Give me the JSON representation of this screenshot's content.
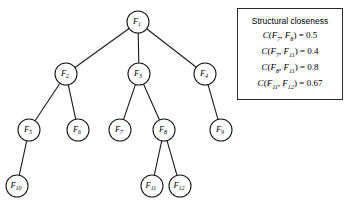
{
  "figure": {
    "type": "tree-diagram",
    "background_color": "#ffffff",
    "line_color": "#1a1a1a"
  },
  "tree": {
    "nodes": [
      {
        "id": "F1",
        "base": "F",
        "sub": "1",
        "cx": 138,
        "cy": 22,
        "r": 11
      },
      {
        "id": "F2",
        "base": "F",
        "sub": "2",
        "cx": 66,
        "cy": 74,
        "r": 11
      },
      {
        "id": "F3",
        "base": "F",
        "sub": "3",
        "cx": 139,
        "cy": 74,
        "r": 11
      },
      {
        "id": "F4",
        "base": "F",
        "sub": "4",
        "cx": 205,
        "cy": 74,
        "r": 11
      },
      {
        "id": "F5",
        "base": "F",
        "sub": "5",
        "cx": 29,
        "cy": 130,
        "r": 11
      },
      {
        "id": "F6",
        "base": "F",
        "sub": "6",
        "cx": 78,
        "cy": 130,
        "r": 11
      },
      {
        "id": "F7",
        "base": "F",
        "sub": "7",
        "cx": 120,
        "cy": 130,
        "r": 11
      },
      {
        "id": "F8",
        "base": "F",
        "sub": "8",
        "cx": 164,
        "cy": 130,
        "r": 11
      },
      {
        "id": "F9",
        "base": "F",
        "sub": "9",
        "cx": 221,
        "cy": 130,
        "r": 11
      },
      {
        "id": "F10",
        "base": "F",
        "sub": "10",
        "cx": 17,
        "cy": 186,
        "r": 11
      },
      {
        "id": "F11",
        "base": "F",
        "sub": "11",
        "cx": 152,
        "cy": 186,
        "r": 11
      },
      {
        "id": "F12",
        "base": "F",
        "sub": "12",
        "cx": 180,
        "cy": 186,
        "r": 11
      }
    ],
    "edges": [
      {
        "from": "F1",
        "to": "F2"
      },
      {
        "from": "F1",
        "to": "F3"
      },
      {
        "from": "F1",
        "to": "F4"
      },
      {
        "from": "F2",
        "to": "F5"
      },
      {
        "from": "F2",
        "to": "F6"
      },
      {
        "from": "F3",
        "to": "F7"
      },
      {
        "from": "F3",
        "to": "F8"
      },
      {
        "from": "F4",
        "to": "F9"
      },
      {
        "from": "F5",
        "to": "F10"
      },
      {
        "from": "F8",
        "to": "F11"
      },
      {
        "from": "F8",
        "to": "F12"
      }
    ]
  },
  "legend": {
    "title": "Structural closeness",
    "rows": [
      {
        "fn": "C",
        "a_base": "F",
        "a_sub": "7",
        "b_base": "F",
        "b_sub": "8",
        "value": "0.5"
      },
      {
        "fn": "C",
        "a_base": "F",
        "a_sub": "7",
        "b_base": "F",
        "b_sub": "11",
        "value": "0.4"
      },
      {
        "fn": "C",
        "a_base": "F",
        "a_sub": "8",
        "b_base": "F",
        "b_sub": "11",
        "value": "0.8"
      },
      {
        "fn": "C",
        "a_base": "F",
        "a_sub": "11",
        "b_base": "F",
        "b_sub": "12",
        "value": "0.67"
      }
    ]
  }
}
